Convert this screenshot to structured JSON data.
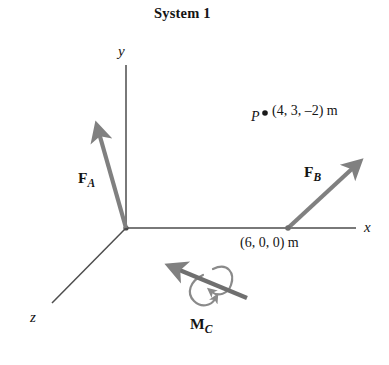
{
  "figure": {
    "title": "System 1",
    "background_color": "#ffffff",
    "axis_color": "#4d4d4d",
    "vector_color": "#808080",
    "text_color": "#141414",
    "point_color": "#1a1a1a"
  },
  "axes": [
    {
      "name": "y-axis",
      "label": "y",
      "direction": "up",
      "label_x": 118,
      "label_y": 44
    },
    {
      "name": "x-axis",
      "label": "x",
      "direction": "right",
      "label_x": 364,
      "label_y": 220
    },
    {
      "name": "z-axis",
      "label": "z",
      "direction": "down-left",
      "label_x": 30,
      "label_y": 310
    }
  ],
  "origin": {
    "label": "",
    "x": 126,
    "y": 228
  },
  "vectors": [
    {
      "name": "force-a",
      "symbol": "F",
      "subscript": "A",
      "kind": "force",
      "tail": [
        126,
        228
      ],
      "tip": [
        96,
        124
      ],
      "label_x": 78,
      "label_y": 170
    },
    {
      "name": "force-b",
      "symbol": "F",
      "subscript": "B",
      "kind": "force",
      "tail": [
        288,
        228
      ],
      "tip": [
        361,
        160
      ],
      "label_x": 304,
      "label_y": 164
    },
    {
      "name": "moment-c",
      "symbol": "M",
      "subscript": "C",
      "kind": "moment",
      "tail": [
        247,
        298
      ],
      "tip": [
        170,
        266
      ],
      "label_x": 190,
      "label_y": 316
    }
  ],
  "points": [
    {
      "name": "point-p",
      "label": "P",
      "coordinates": "(4, 3, –2) m",
      "dot_x": 265,
      "dot_y": 113,
      "label_x": 251,
      "label_y": 110,
      "coord_x": 272,
      "coord_y": 104
    },
    {
      "name": "point-force-b-application",
      "label": "",
      "coordinates": "(6, 0, 0) m",
      "dot_x": 288,
      "dot_y": 228,
      "label_x": 0,
      "label_y": 0,
      "coord_x": 240,
      "coord_y": 236
    }
  ]
}
